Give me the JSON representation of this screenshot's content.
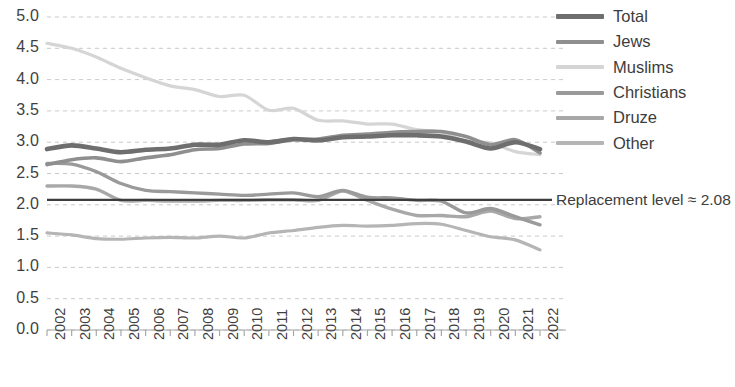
{
  "chart_data": {
    "type": "line",
    "title": "",
    "xlabel": "",
    "ylabel": "",
    "ylim": [
      0.0,
      5.0
    ],
    "ytick_step": 0.5,
    "grid": true,
    "grid_style": "dashed-horizontal",
    "legend_position": "right",
    "x": [
      2002,
      2003,
      2004,
      2005,
      2006,
      2007,
      2008,
      2009,
      2010,
      2011,
      2012,
      2013,
      2014,
      2015,
      2016,
      2017,
      2018,
      2019,
      2020,
      2021,
      2022
    ],
    "ytick_labels": [
      "0.0",
      "0.5",
      "1.0",
      "1.5",
      "2.0",
      "2.5",
      "3.0",
      "3.5",
      "4.0",
      "4.5",
      "5.0"
    ],
    "ytick_values": [
      0.0,
      0.5,
      1.0,
      1.5,
      2.0,
      2.5,
      3.0,
      3.5,
      4.0,
      4.5,
      5.0
    ],
    "xtick_labels": [
      "2002",
      "2003",
      "2004",
      "2005",
      "2006",
      "2007",
      "2008",
      "2009",
      "2010",
      "2011",
      "2012",
      "2013",
      "2014",
      "2015",
      "2016",
      "2017",
      "2018",
      "2019",
      "2020",
      "2021",
      "2022"
    ],
    "series": [
      {
        "name": "Total",
        "color": "#6e6e6e",
        "width": 4.6,
        "values": [
          2.89,
          2.95,
          2.9,
          2.84,
          2.88,
          2.9,
          2.96,
          2.96,
          3.03,
          3.0,
          3.05,
          3.03,
          3.08,
          3.09,
          3.11,
          3.11,
          3.09,
          3.01,
          2.9,
          3.0,
          2.89
        ]
      },
      {
        "name": "Jews",
        "color": "#8f8f8f",
        "width": 3.6,
        "values": [
          2.64,
          2.72,
          2.75,
          2.69,
          2.75,
          2.8,
          2.88,
          2.9,
          2.97,
          2.98,
          3.04,
          3.05,
          3.11,
          3.13,
          3.16,
          3.17,
          3.17,
          3.09,
          2.96,
          3.04,
          2.83
        ]
      },
      {
        "name": "Muslims",
        "color": "#d5d5d5",
        "width": 3.2,
        "values": [
          4.58,
          4.5,
          4.36,
          4.18,
          4.03,
          3.9,
          3.84,
          3.73,
          3.75,
          3.51,
          3.54,
          3.35,
          3.34,
          3.29,
          3.29,
          3.2,
          3.16,
          3.01,
          2.99,
          2.85,
          2.8
        ]
      },
      {
        "name": "Christians",
        "color": "#9a9a9a",
        "width": 3.4,
        "values": [
          2.66,
          2.65,
          2.53,
          2.34,
          2.23,
          2.21,
          2.19,
          2.17,
          2.15,
          2.17,
          2.19,
          2.13,
          2.23,
          2.12,
          2.11,
          2.07,
          2.06,
          1.87,
          1.94,
          1.81,
          1.68
        ]
      },
      {
        "name": "Druze",
        "color": "#a8a8a8",
        "width": 3.4,
        "values": [
          2.3,
          2.3,
          2.25,
          2.07,
          2.07,
          2.06,
          2.06,
          2.07,
          2.07,
          2.08,
          2.08,
          2.07,
          2.22,
          2.07,
          1.93,
          1.83,
          1.83,
          1.81,
          1.9,
          1.78,
          1.81
        ]
      },
      {
        "name": "Other",
        "color": "#b5b5b5",
        "width": 3.2,
        "values": [
          1.55,
          1.52,
          1.46,
          1.45,
          1.47,
          1.48,
          1.47,
          1.5,
          1.47,
          1.55,
          1.59,
          1.64,
          1.67,
          1.66,
          1.67,
          1.7,
          1.69,
          1.59,
          1.49,
          1.44,
          1.28
        ]
      }
    ],
    "annotations": [
      {
        "name": "replacement-level",
        "label": "Replacement level ≈ 2.08",
        "value": 2.08,
        "color": "#3d3d3d",
        "style": "solid-horizontal-line"
      }
    ]
  },
  "legend": {
    "items": [
      {
        "label": "Total"
      },
      {
        "label": "Jews"
      },
      {
        "label": "Muslims"
      },
      {
        "label": "Christians"
      },
      {
        "label": "Druze"
      },
      {
        "label": "Other"
      }
    ]
  },
  "axis": {
    "y_labels": [
      "5.0",
      "4.5",
      "4.0",
      "3.5",
      "3.0",
      "2.5",
      "2.0",
      "1.5",
      "1.0",
      "0.5",
      "0.0"
    ],
    "x_labels": [
      "2002",
      "2003",
      "2004",
      "2005",
      "2006",
      "2007",
      "2008",
      "2009",
      "2010",
      "2011",
      "2012",
      "2013",
      "2014",
      "2015",
      "2016",
      "2017",
      "2018",
      "2019",
      "2020",
      "2021",
      "2022"
    ]
  },
  "annotation_text": {
    "replacement_level": "Replacement level ≈ 2.08"
  },
  "colors": {
    "total": "#6e6e6e",
    "jews": "#8f8f8f",
    "muslims": "#d5d5d5",
    "christians": "#9a9a9a",
    "druze": "#a8a8a8",
    "other": "#b5b5b5",
    "gridline": "#c9c9c9",
    "axis": "#a8a8a8",
    "text": "#3d3d3d"
  }
}
